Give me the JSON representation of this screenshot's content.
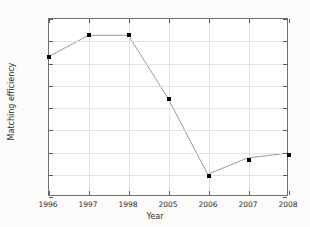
{
  "chart_data": {
    "type": "line",
    "title": "",
    "xlabel": "Year",
    "ylabel": "Matching efficiency",
    "categories": [
      "1996",
      "1997",
      "1998",
      "2005",
      "2006",
      "2007",
      "2008"
    ],
    "values": [
      0.565,
      0.613,
      0.613,
      0.47,
      0.297,
      0.334,
      0.345
    ],
    "ylim": [
      0.25,
      0.65
    ],
    "yticks": [
      "0.25",
      "0.30",
      "0.35",
      "0.40",
      "0.45",
      "0.50",
      "0.55",
      "0.60",
      "0.65"
    ],
    "ytick_values": [
      0.25,
      0.3,
      0.35,
      0.4,
      0.45,
      0.5,
      0.55,
      0.6,
      0.65
    ],
    "xticks": [
      "1996",
      "1997",
      "1998",
      "2005",
      "2006",
      "2007",
      "2008"
    ],
    "grid": true,
    "legend": null,
    "marker": "filled-square",
    "line_color": "#808080",
    "marker_color": "#000000",
    "background_color": "#fbfbfa",
    "plot_background_color": "#ffffff",
    "grid_color": "#e2e2e2",
    "axis_color": "#6e6e6e"
  }
}
